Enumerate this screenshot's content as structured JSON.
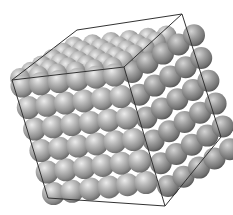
{
  "image": {
    "subject": "sphere-packed crystal lattice inside cube",
    "width": 233,
    "height": 215,
    "background": "#ffffff"
  },
  "colors": {
    "sphere_highlight": "#e8e8e8",
    "sphere_mid": "#a6a6a6",
    "sphere_shadow": "#5a5a5a",
    "edge": "#333333"
  },
  "cube": {
    "vertices": {
      "A_front_top_left": [
        12,
        80
      ],
      "B_front_top_near": [
        124,
        67
      ],
      "C_top_back_left": [
        77,
        30
      ],
      "D_top_back_right": [
        182,
        14
      ],
      "E_right_mid": [
        221,
        137
      ],
      "F_bottom_near": [
        165,
        206
      ],
      "G_bottom_left": [
        48,
        198
      ]
    },
    "edges": [
      [
        "A_front_top_left",
        "B_front_top_near"
      ],
      [
        "A_front_top_left",
        "C_top_back_left"
      ],
      [
        "C_top_back_left",
        "D_top_back_right"
      ],
      [
        "B_front_top_near",
        "D_top_back_right"
      ],
      [
        "D_top_back_right",
        "E_right_mid"
      ],
      [
        "B_front_top_near",
        "F_bottom_near"
      ],
      [
        "E_right_mid",
        "F_bottom_near"
      ],
      [
        "A_front_top_left",
        "G_bottom_left"
      ],
      [
        "G_bottom_left",
        "F_bottom_near"
      ]
    ]
  },
  "lattice": {
    "rows": 6,
    "cols": 6,
    "sphere_radius": 11,
    "faces": [
      {
        "name": "top",
        "origin": [
          20,
          78
        ],
        "u": [
          18.5,
          -2.2
        ],
        "v": [
          10.8,
          -6.3
        ],
        "n": 6,
        "m": 6,
        "r": 10
      },
      {
        "name": "left",
        "origin": [
          22,
          86
        ],
        "u": [
          18.5,
          -2.2
        ],
        "v": [
          6.3,
          21.5
        ],
        "n": 6,
        "m": 6,
        "r": 11.5
      },
      {
        "name": "right",
        "origin": [
          132,
          72
        ],
        "u": [
          15.5,
          -9.2
        ],
        "v": [
          7.2,
          22.8
        ],
        "n": 5,
        "m": 6,
        "r": 11
      }
    ]
  }
}
